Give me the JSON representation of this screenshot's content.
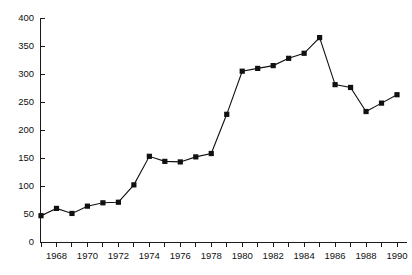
{
  "chart_data": {
    "type": "line",
    "title": "",
    "subtitle": "",
    "xlabel": "",
    "ylabel": "",
    "x": [
      1967,
      1968,
      1969,
      1970,
      1971,
      1972,
      1973,
      1974,
      1975,
      1976,
      1977,
      1978,
      1979,
      1980,
      1981,
      1982,
      1983,
      1984,
      1985,
      1986,
      1987,
      1988,
      1989,
      1990
    ],
    "values": [
      47,
      60,
      51,
      64,
      70,
      71,
      102,
      153,
      144,
      143,
      152,
      158,
      228,
      305,
      310,
      315,
      328,
      337,
      365,
      281,
      276,
      233,
      248,
      263
    ],
    "series": [
      {
        "name": "",
        "values": [
          47,
          60,
          51,
          64,
          70,
          71,
          102,
          153,
          144,
          143,
          152,
          158,
          228,
          305,
          310,
          315,
          328,
          337,
          365,
          281,
          276,
          233,
          248,
          263
        ]
      }
    ],
    "xlim": [
      1967,
      1990
    ],
    "ylim": [
      0,
      400
    ],
    "ytick_labels": [
      "0",
      "50",
      "100",
      "150",
      "200",
      "250",
      "300",
      "350",
      "400"
    ],
    "ytick_values": [
      0,
      50,
      100,
      150,
      200,
      250,
      300,
      350,
      400
    ],
    "xtick_values": [
      1967,
      1968,
      1969,
      1970,
      1971,
      1972,
      1973,
      1974,
      1975,
      1976,
      1977,
      1978,
      1979,
      1980,
      1981,
      1982,
      1983,
      1984,
      1985,
      1986,
      1987,
      1988,
      1989,
      1990
    ],
    "xtick_labels_shown": [
      "1968",
      "1970",
      "1972",
      "1974",
      "1976",
      "1978",
      "1980",
      "1982",
      "1984",
      "1986",
      "1988",
      "1990"
    ],
    "xtick_labels_shown_values": [
      1968,
      1970,
      1972,
      1974,
      1976,
      1978,
      1980,
      1982,
      1984,
      1986,
      1988,
      1990
    ],
    "grid": false,
    "legend": "none",
    "marker": "square",
    "line_color": "#111111",
    "marker_color": "#111111",
    "axis_color": "#1a1a1a",
    "background_color": "#ffffff"
  }
}
